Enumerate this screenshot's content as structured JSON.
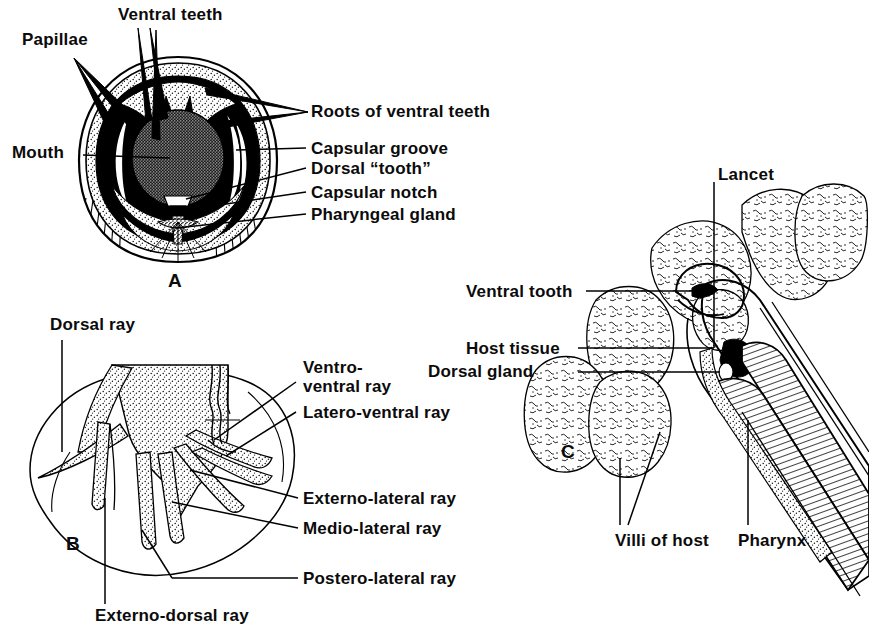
{
  "figure": {
    "ink_color": "#000000",
    "background_color": "#ffffff",
    "panel_letters": [
      "A",
      "B",
      "C"
    ]
  },
  "panel_a": {
    "letter": "A",
    "description": "Anterior end of hookworm, en face view of buccal capsule",
    "labels": {
      "papillae": "Papillae",
      "ventral_teeth": "Ventral teeth",
      "mouth": "Mouth",
      "roots_of_ventral_teeth": "Roots of ventral teeth",
      "capsular_groove": "Capsular groove",
      "dorsal_tooth": "Dorsal “tooth”",
      "capsular_notch": "Capsular notch",
      "pharyngeal_gland": "Pharyngeal gland"
    }
  },
  "panel_b": {
    "letter": "B",
    "description": "Copulatory bursa of male hookworm showing bursal rays",
    "labels": {
      "dorsal_ray": "Dorsal ray",
      "ventro_ventral_ray": "Ventro-\nventral ray",
      "latero_ventral_ray": "Latero-ventral ray",
      "externo_lateral_ray": "Externo-lateral ray",
      "medio_lateral_ray": "Medio-lateral ray",
      "postero_lateral_ray": "Postero-lateral ray",
      "externo_dorsal_ray": "Externo-dorsal ray"
    }
  },
  "panel_c": {
    "letter": "C",
    "description": "Sagittal section of hookworm attached to intestinal mucosa of host",
    "labels": {
      "lancet": "Lancet",
      "ventral_tooth": "Ventral tooth",
      "host_tissue": "Host tissue",
      "dorsal_gland": "Dorsal gland",
      "villi_of_host": "Villi of host",
      "pharynx": "Pharynx"
    }
  }
}
